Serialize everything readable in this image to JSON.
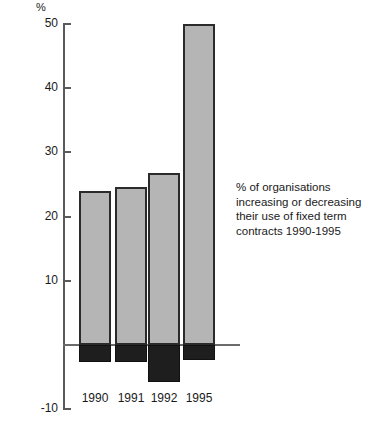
{
  "chart_data": {
    "type": "bar",
    "title": "",
    "subtitle": "",
    "xlabel": "",
    "ylabel": "%",
    "ylim": [
      -10,
      50
    ],
    "yticks": [
      50,
      40,
      30,
      20,
      10,
      0,
      -10
    ],
    "ytick_labels": [
      "50",
      "40",
      "30",
      "20",
      "10",
      "",
      "-10"
    ],
    "grid": false,
    "legend": null,
    "categories": [
      "1990",
      "1991",
      "1992",
      "1995"
    ],
    "series": [
      {
        "name": "increasing",
        "color": "#b5b5b5",
        "values": [
          24,
          24.6,
          26.8,
          50
        ]
      },
      {
        "name": "decreasing",
        "color": "#1e1e1e",
        "values": [
          -2.6,
          -2.6,
          -5.8,
          -2.3
        ]
      }
    ],
    "annotations": [
      "% of organisations",
      "increasing or decreasing",
      "their use of fixed term",
      "contracts 1990-1995"
    ]
  },
  "axis": {
    "unit_label": "%",
    "zero_label": ""
  },
  "caption": {
    "line1": "% of organisations",
    "line2": "increasing or decreasing",
    "line3": "their use of fixed term",
    "line4": "contracts 1990-1995"
  },
  "colors": {
    "positive_bar_fill": "#b5b5b5",
    "positive_bar_stroke": "#2b2b2b",
    "negative_bar_fill": "#1e1e1e",
    "axis": "#5a5a5a",
    "text": "#1a1a1a",
    "background": "#ffffff"
  }
}
